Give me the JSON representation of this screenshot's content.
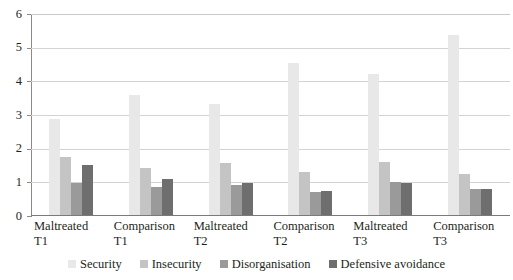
{
  "chart_data": {
    "type": "bar",
    "title": "",
    "subtitle": "",
    "xlabel": "",
    "ylabel": "",
    "ylim": [
      0,
      6
    ],
    "y_ticks": [
      0,
      1,
      2,
      3,
      4,
      5,
      6
    ],
    "grid": true,
    "legend_position": "bottom",
    "orientation": "vertical",
    "grouping": "clustered",
    "categories": [
      "Maltreated T1",
      "Comparison T1",
      "Maltreated T2",
      "Comparison T2",
      "Maltreated T3",
      "Comparison T3"
    ],
    "category_lines": [
      [
        "Maltreated",
        "T1"
      ],
      [
        "Comparison",
        "T1"
      ],
      [
        "Maltreated",
        "T2"
      ],
      [
        "Comparison",
        "T2"
      ],
      [
        "Maltreated",
        "T3"
      ],
      [
        "Comparison",
        "T3"
      ]
    ],
    "series": [
      {
        "name": "Security",
        "color": "#e8e8e8",
        "values": [
          2.87,
          3.6,
          3.33,
          4.55,
          4.22,
          5.37
        ]
      },
      {
        "name": "Insecurity",
        "color": "#c4c4c4",
        "values": [
          1.75,
          1.42,
          1.57,
          1.31,
          1.59,
          1.24
        ]
      },
      {
        "name": "Disorganisation",
        "color": "#9a9a9a",
        "values": [
          0.97,
          0.85,
          0.92,
          0.7,
          1.01,
          0.8
        ]
      },
      {
        "name": "Defensive avoidance",
        "color": "#6e6e6e",
        "values": [
          1.53,
          1.1,
          0.99,
          0.74,
          0.98,
          0.79
        ]
      }
    ]
  },
  "axis": {
    "y_tick_labels": [
      "0",
      "1",
      "2",
      "3",
      "4",
      "5",
      "6"
    ]
  },
  "legend": {
    "items": [
      {
        "label": "Security",
        "color": "#e8e8e8"
      },
      {
        "label": "Insecurity",
        "color": "#c4c4c4"
      },
      {
        "label": "Disorganisation",
        "color": "#9a9a9a"
      },
      {
        "label": "Defensive avoidance",
        "color": "#6e6e6e"
      }
    ]
  },
  "colors": {
    "gridline": "#d3d3d3",
    "axis": "#8a8a8a",
    "text": "#231f20",
    "background": "#ffffff"
  }
}
